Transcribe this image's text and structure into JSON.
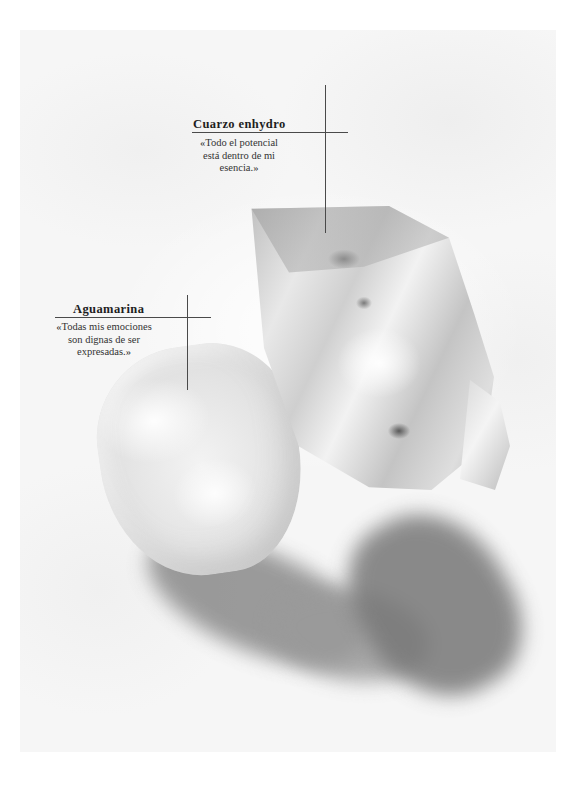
{
  "page": {
    "photo_subject": "Two crystals: a clear enhydro quartz point and a pale tumbled aquamarine on white surface"
  },
  "callouts": [
    {
      "id": "cuarzo-enhydro",
      "title": "Cuarzo enhydro",
      "body_lines": [
        "«Todo el potencial",
        "está dentro de mi",
        "esencia.»"
      ]
    },
    {
      "id": "aguamarina",
      "title": "Aguamarina",
      "body_lines": [
        "«Todas mis emociones",
        "son dignas de ser",
        "expresadas.»"
      ]
    }
  ],
  "colors": {
    "page_background": "#ffffff",
    "photo_background": "#f6f6f6",
    "text": "#2a2a2a",
    "rule_lines": "#4a4a4a"
  }
}
